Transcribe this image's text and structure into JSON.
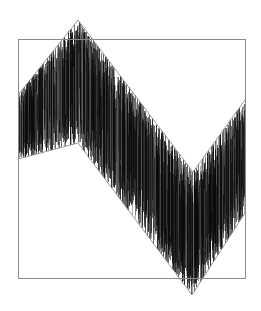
{
  "figure": {
    "title": "",
    "background_color": "#ffffff",
    "width": 261,
    "height": 311
  },
  "frame": {
    "label": "plot-frame",
    "x": 18,
    "y": 39,
    "width": 227,
    "height": 239,
    "stroke_color": "#8a8a8a",
    "stroke_width": 1,
    "fill": "none"
  },
  "envelope_style": {
    "stroke_color": "#8f8f8f",
    "stroke_width": 0.9
  },
  "signal_style": {
    "stroke_color": "#0a0a0a",
    "secondary_color": "#5a5a5a",
    "stroke_width": 0.6
  },
  "chart_data": {
    "type": "line",
    "title": "",
    "subtitle": "",
    "xlabel": "",
    "ylabel": "",
    "grid": false,
    "legend": "none",
    "xlim": [
      18,
      245
    ],
    "ylim": [
      20,
      295
    ],
    "series": [
      {
        "name": "upper-envelope",
        "type": "line",
        "color": "#8f8f8f",
        "x": [
          18,
          78,
          193,
          245
        ],
        "y": [
          95,
          20,
          172,
          100
        ]
      },
      {
        "name": "lower-envelope",
        "type": "line",
        "color": "#8f8f8f",
        "x": [
          18,
          78,
          192,
          245
        ],
        "y": [
          159,
          143,
          295,
          213
        ]
      },
      {
        "name": "noise-signal",
        "type": "vertical-lines",
        "color": "#0a0a0a",
        "n_samples": 420,
        "x_start": 18,
        "x_end": 245,
        "note": "Dense vertical strokes whose extent at each x is a random fraction of the distance between the upper and lower envelopes."
      }
    ],
    "annotations": []
  }
}
